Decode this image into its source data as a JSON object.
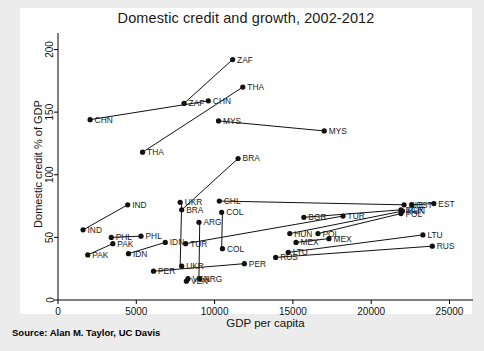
{
  "chart_data": {
    "type": "scatter",
    "title": "Domestic credit and growth, 2002-2012",
    "xlabel": "GDP per capita",
    "ylabel": "Domestic credit % of GDP",
    "source": "Source: Alan M. Taylor, UC Davis",
    "xlim": [
      0,
      26500
    ],
    "ylim": [
      0,
      210
    ],
    "xticks": [
      0,
      5000,
      10000,
      15000,
      20000,
      25000
    ],
    "xticklabels": [
      "0",
      "5000",
      "10000",
      "15000",
      "20000",
      "25000"
    ],
    "yticks": [
      0,
      50,
      100,
      150,
      200
    ],
    "yticklabels": [
      "0",
      "50",
      "100",
      "150",
      "200"
    ],
    "grid": false,
    "legend": false,
    "note": "Each country is two points (2002 and 2012) joined by a straight connector line; labels sit to the right of each marker.",
    "series": [
      {
        "name": "ZAF",
        "x": [
          8050,
          11150
        ],
        "y": [
          157,
          192
        ]
      },
      {
        "name": "THA",
        "x": [
          5400,
          11800
        ],
        "y": [
          118,
          170
        ]
      },
      {
        "name": "CHN",
        "x": [
          2050,
          9600
        ],
        "y": [
          144,
          159
        ]
      },
      {
        "name": "MYS",
        "x": [
          10250,
          17000
        ],
        "y": [
          143,
          135
        ]
      },
      {
        "name": "BRA",
        "x": [
          7900,
          11500
        ],
        "y": [
          72,
          113
        ]
      },
      {
        "name": "IND",
        "x": [
          1600,
          4450
        ],
        "y": [
          56,
          76
        ]
      },
      {
        "name": "UKR",
        "x": [
          7800,
          7900
        ],
        "y": [
          27,
          78
        ]
      },
      {
        "name": "CHL",
        "x": [
          10300,
          22100
        ],
        "y": [
          79,
          76
        ]
      },
      {
        "name": "COL",
        "x": [
          10450,
          10500
        ],
        "y": [
          41,
          70
        ]
      },
      {
        "name": "ARG",
        "x": [
          9000,
          9050
        ],
        "y": [
          17,
          62
        ]
      },
      {
        "name": "BGR",
        "x": [
          15700,
          21900
        ],
        "y": [
          66,
          72
        ]
      },
      {
        "name": "TUR",
        "x": [
          8150,
          18200
        ],
        "y": [
          45,
          67
        ]
      },
      {
        "name": "EST",
        "x": [
          22600,
          24000
        ],
        "y": [
          76,
          77
        ]
      },
      {
        "name": "HUN",
        "x": [
          14800,
          22000
        ],
        "y": [
          53,
          71
        ]
      },
      {
        "name": "POL",
        "x": [
          16600,
          21900
        ],
        "y": [
          53,
          69
        ]
      },
      {
        "name": "MEX",
        "x": [
          15200,
          17300
        ],
        "y": [
          46,
          49
        ]
      },
      {
        "name": "LTU",
        "x": [
          14700,
          23300
        ],
        "y": [
          38,
          52
        ]
      },
      {
        "name": "RUS",
        "x": [
          13900,
          23900
        ],
        "y": [
          34,
          43
        ]
      },
      {
        "name": "PHL",
        "x": [
          3400,
          5300
        ],
        "y": [
          50,
          51
        ]
      },
      {
        "name": "IDN",
        "x": [
          4500,
          6850
        ],
        "y": [
          37,
          46
        ]
      },
      {
        "name": "PAK",
        "x": [
          1900,
          3500
        ],
        "y": [
          36,
          45
        ]
      },
      {
        "name": "PER",
        "x": [
          6100,
          11900
        ],
        "y": [
          23,
          29
        ]
      },
      {
        "name": "VEN",
        "x": [
          8200,
          8300
        ],
        "y": [
          15,
          17
        ]
      }
    ],
    "points": [
      {
        "label": "ZAF",
        "x": 8050,
        "y": 157
      },
      {
        "label": "ZAF",
        "x": 11150,
        "y": 192
      },
      {
        "label": "THA",
        "x": 5400,
        "y": 118
      },
      {
        "label": "THA",
        "x": 11800,
        "y": 170
      },
      {
        "label": "CHN",
        "x": 2050,
        "y": 144
      },
      {
        "label": "CHN",
        "x": 9600,
        "y": 159
      },
      {
        "label": "MYS",
        "x": 10250,
        "y": 143
      },
      {
        "label": "MYS",
        "x": 17000,
        "y": 135
      },
      {
        "label": "BRA",
        "x": 7900,
        "y": 72
      },
      {
        "label": "BRA",
        "x": 11500,
        "y": 113
      },
      {
        "label": "IND",
        "x": 1600,
        "y": 56
      },
      {
        "label": "IND",
        "x": 4450,
        "y": 76
      },
      {
        "label": "UKR",
        "x": 7800,
        "y": 78
      },
      {
        "label": "UKR",
        "x": 7900,
        "y": 27
      },
      {
        "label": "CHL",
        "x": 10300,
        "y": 79
      },
      {
        "label": "CHL",
        "x": 22100,
        "y": 76
      },
      {
        "label": "COL",
        "x": 10450,
        "y": 70
      },
      {
        "label": "COL",
        "x": 10500,
        "y": 41
      },
      {
        "label": "ARG",
        "x": 9000,
        "y": 62
      },
      {
        "label": "ARG",
        "x": 9050,
        "y": 17
      },
      {
        "label": "BGR",
        "x": 15700,
        "y": 66
      },
      {
        "label": "BGR",
        "x": 21900,
        "y": 72
      },
      {
        "label": "TUR",
        "x": 8150,
        "y": 45
      },
      {
        "label": "TUR",
        "x": 18200,
        "y": 67
      },
      {
        "label": "EST",
        "x": 22600,
        "y": 76
      },
      {
        "label": "EST",
        "x": 24000,
        "y": 77
      },
      {
        "label": "HUN",
        "x": 14800,
        "y": 53
      },
      {
        "label": "HUN",
        "x": 22000,
        "y": 71
      },
      {
        "label": "POL",
        "x": 16600,
        "y": 53
      },
      {
        "label": "POL",
        "x": 21900,
        "y": 69
      },
      {
        "label": "MEX",
        "x": 15200,
        "y": 46
      },
      {
        "label": "MEX",
        "x": 17300,
        "y": 49
      },
      {
        "label": "LTU",
        "x": 14700,
        "y": 38
      },
      {
        "label": "LTU",
        "x": 23300,
        "y": 52
      },
      {
        "label": "RUS",
        "x": 13900,
        "y": 34
      },
      {
        "label": "RUS",
        "x": 23900,
        "y": 43
      },
      {
        "label": "PHL",
        "x": 3400,
        "y": 50
      },
      {
        "label": "PHL",
        "x": 5300,
        "y": 51
      },
      {
        "label": "IDN",
        "x": 4500,
        "y": 37
      },
      {
        "label": "IDN",
        "x": 6850,
        "y": 46
      },
      {
        "label": "PAK",
        "x": 1900,
        "y": 36
      },
      {
        "label": "PAK",
        "x": 3500,
        "y": 45
      },
      {
        "label": "PER",
        "x": 6100,
        "y": 23
      },
      {
        "label": "PER",
        "x": 11900,
        "y": 29
      },
      {
        "label": "VEN",
        "x": 8200,
        "y": 15
      },
      {
        "label": "VEN",
        "x": 8300,
        "y": 17
      }
    ]
  }
}
